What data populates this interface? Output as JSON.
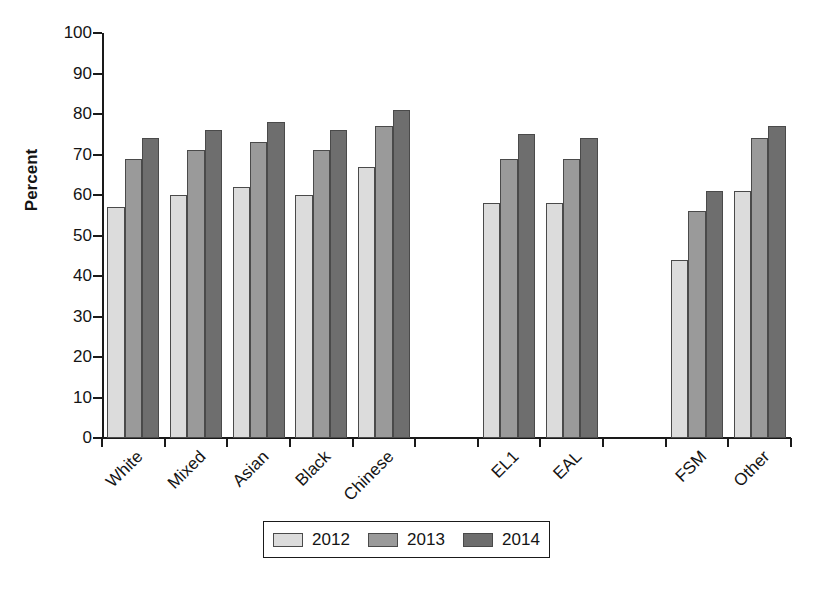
{
  "chart_data": {
    "type": "bar",
    "title": "",
    "xlabel": "",
    "ylabel": "Percent",
    "ylim": [
      0,
      100
    ],
    "y_ticks": [
      0,
      10,
      20,
      30,
      40,
      50,
      60,
      70,
      80,
      90,
      100
    ],
    "grid": false,
    "legend_position": "bottom",
    "categories": [
      "White",
      "Mixed",
      "Asian",
      "Black",
      "Chinese",
      "EL1",
      "EAL",
      "FSM",
      "Other"
    ],
    "group_breaks_after": [
      "Chinese",
      "EAL"
    ],
    "series": [
      {
        "name": "2012",
        "color": "#dcdcdc",
        "values": [
          57,
          60,
          62,
          60,
          67,
          58,
          58,
          44,
          61
        ]
      },
      {
        "name": "2013",
        "color": "#9a9a9a",
        "values": [
          69,
          71,
          73,
          71,
          77,
          69,
          69,
          56,
          74
        ]
      },
      {
        "name": "2014",
        "color": "#6e6e6e",
        "values": [
          74,
          76,
          78,
          76,
          81,
          75,
          74,
          61,
          77
        ]
      }
    ]
  },
  "axis": {
    "y_title": "Percent",
    "y_tick_labels": [
      "100",
      "90",
      "80",
      "70",
      "60",
      "50",
      "40",
      "30",
      "20",
      "10",
      "0"
    ]
  },
  "legend": {
    "items": [
      {
        "label": "2012",
        "series": "s2012"
      },
      {
        "label": "2013",
        "series": "s2013"
      },
      {
        "label": "2014",
        "series": "s2014"
      }
    ]
  }
}
